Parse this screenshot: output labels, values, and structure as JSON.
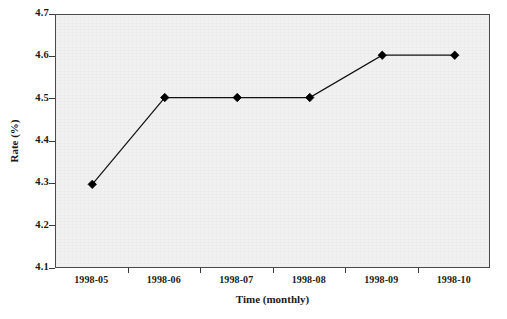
{
  "chart_data": {
    "type": "line",
    "title": "",
    "xlabel": "Time (monthly)",
    "ylabel": "Rate (%)",
    "categories": [
      "1998-05",
      "1998-06",
      "1998-07",
      "1998-08",
      "1998-09",
      "1998-10"
    ],
    "values": [
      4.3,
      4.505,
      4.505,
      4.505,
      4.605,
      4.605
    ],
    "series": [
      {
        "name": "Rate",
        "values": [
          4.3,
          4.505,
          4.505,
          4.505,
          4.605,
          4.605
        ]
      }
    ],
    "ylim": [
      4.1,
      4.7
    ],
    "yticks": [
      "4.1",
      "4.2",
      "4.3",
      "4.4",
      "4.5",
      "4.6",
      "4.7"
    ],
    "ytick_values": [
      4.1,
      4.2,
      4.3,
      4.4,
      4.5,
      4.6,
      4.7
    ],
    "xticks": [
      "1998-05",
      "1998-06",
      "1998-07",
      "1998-08",
      "1998-09",
      "1998-10"
    ],
    "grid": false,
    "legend": "none",
    "marker": "filled-diamond",
    "line_color": "#111111",
    "marker_color": "#000000",
    "plot_background": "#f1f1f1",
    "figure_background": "#ffffff",
    "axis_color": "#4a4a4a"
  }
}
